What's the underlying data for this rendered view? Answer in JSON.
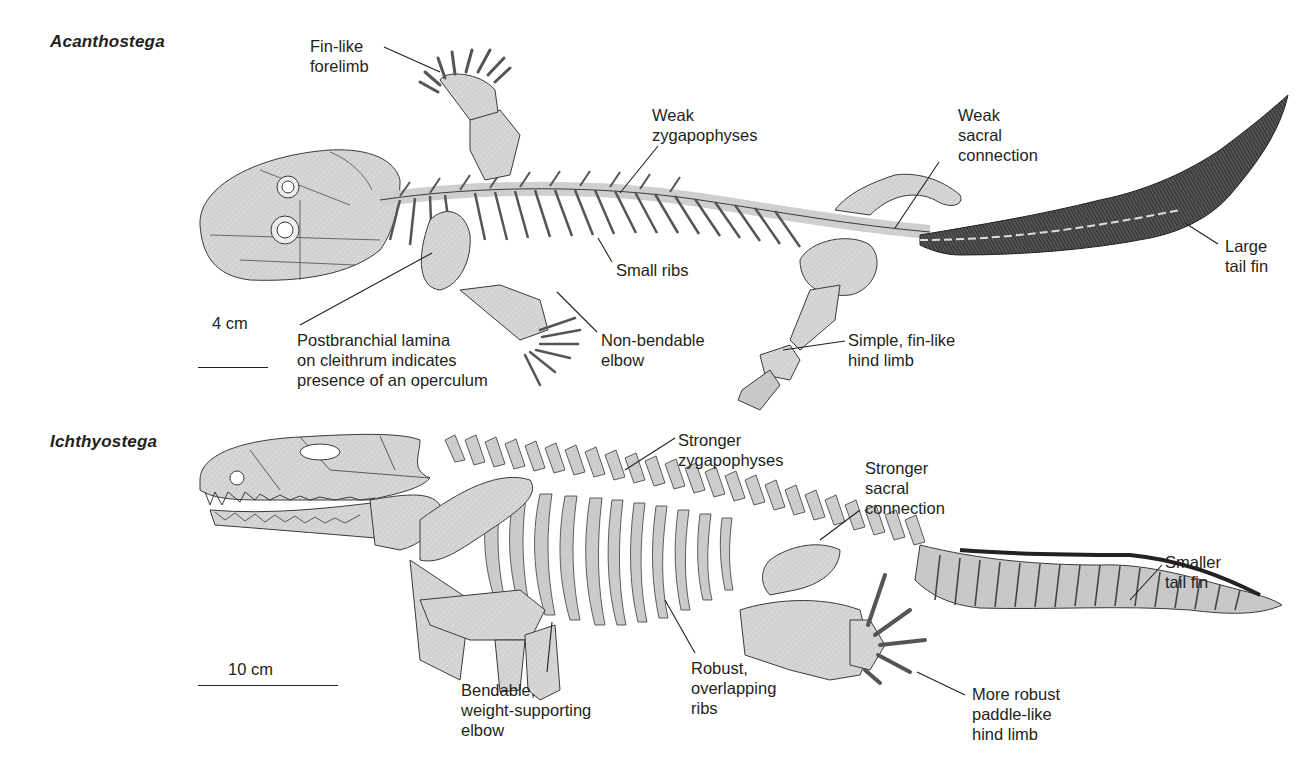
{
  "figure": {
    "panels": [
      {
        "species": "Acanthostega",
        "scale": {
          "label": "4 cm"
        },
        "labels": [
          {
            "id": "fin-like-forelimb",
            "text": "Fin-like\nforelimb"
          },
          {
            "id": "weak-zygapophyses",
            "text": "Weak\nzygapophyses"
          },
          {
            "id": "weak-sacral-connection",
            "text": "Weak\nsacral\nconnection"
          },
          {
            "id": "small-ribs",
            "text": "Small ribs"
          },
          {
            "id": "large-tail-fin",
            "text": "Large\ntail fin"
          },
          {
            "id": "postbranchial-lamina",
            "text": "Postbranchial lamina\non cleithrum indicates\npresence of an operculum"
          },
          {
            "id": "non-bendable-elbow",
            "text": "Non-bendable\nelbow"
          },
          {
            "id": "simple-hind-limb",
            "text": "Simple, fin-like\nhind limb"
          }
        ]
      },
      {
        "species": "Ichthyostega",
        "scale": {
          "label": "10 cm"
        },
        "labels": [
          {
            "id": "stronger-zygapophyses",
            "text": "Stronger\nzygapophyses"
          },
          {
            "id": "stronger-sacral-connection",
            "text": "Stronger\nsacral\nconnection"
          },
          {
            "id": "smaller-tail-fin",
            "text": "Smaller\ntail fin"
          },
          {
            "id": "bendable-elbow",
            "text": "Bendable,\nweight-supporting\nelbow"
          },
          {
            "id": "robust-ribs",
            "text": "Robust,\noverlapping\nribs"
          },
          {
            "id": "paddle-hind-limb",
            "text": "More robust\npaddle-like\nhind limb"
          }
        ]
      }
    ],
    "colors": {
      "bone": "#d4d4d4",
      "bone_dark": "#b8b8b8",
      "outline": "#3a3a3a",
      "fin": "#3c3c3c",
      "text": "#231f20"
    }
  }
}
